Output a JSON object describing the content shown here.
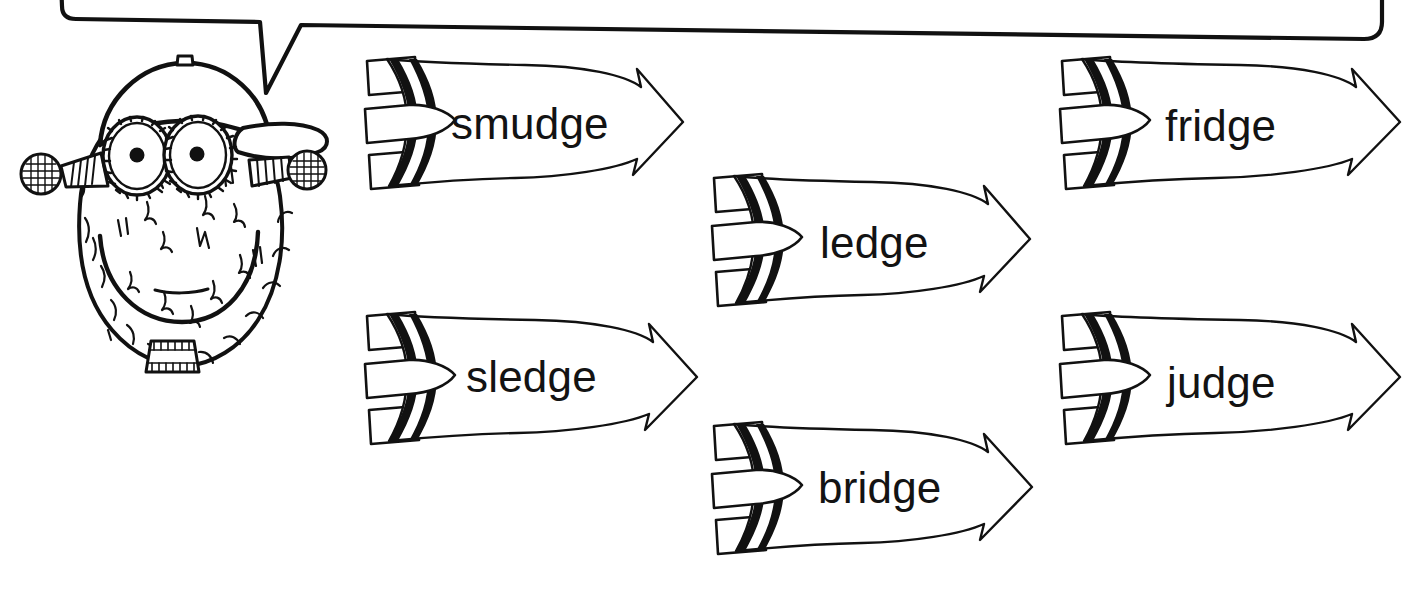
{
  "page": {
    "background_color": "#ffffff",
    "ink_color": "#111111",
    "text_color": "#131313",
    "width": 1412,
    "height": 589
  },
  "speech_bubble": {
    "name": "speech-bubble",
    "text": "",
    "note": "empty rounded speech bubble, cropped at top edge, tail points down-left toward the character"
  },
  "character": {
    "name": "monster-character",
    "description": "cartoon furry monster head wearing a baseball cap",
    "parts": [
      "baseball-cap",
      "cap-button",
      "cap-brim",
      "left-eye",
      "right-eye",
      "left-antenna",
      "right-antenna",
      "smile",
      "lower-lip",
      "neck-collar",
      "fur-tufts"
    ]
  },
  "arrows": [
    {
      "id": "arrow-smudge",
      "label": "smudge",
      "row": 1,
      "column": 1,
      "direction": "right"
    },
    {
      "id": "arrow-ledge",
      "label": "ledge",
      "row": 2,
      "column": 2,
      "direction": "right"
    },
    {
      "id": "arrow-fridge",
      "label": "fridge",
      "row": 1,
      "column": 3,
      "direction": "right"
    },
    {
      "id": "arrow-sledge",
      "label": "sledge",
      "row": 3,
      "column": 1,
      "direction": "right"
    },
    {
      "id": "arrow-bridge",
      "label": "bridge",
      "row": 4,
      "column": 2,
      "direction": "right"
    },
    {
      "id": "arrow-judge",
      "label": "judge",
      "row": 3,
      "column": 3,
      "direction": "right"
    }
  ]
}
